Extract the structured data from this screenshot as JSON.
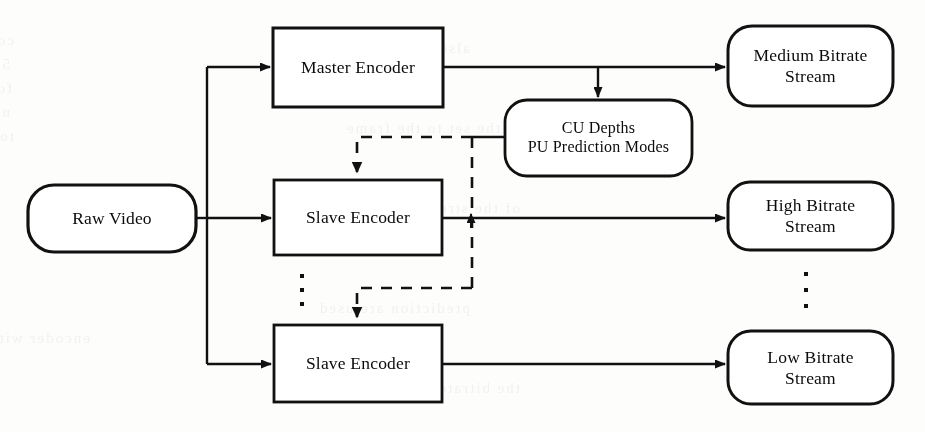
{
  "diagram": {
    "type": "block-flow-diagram",
    "background_color": "#fdfdfc",
    "line_color": "#111111",
    "nodes": [
      {
        "id": "raw-video",
        "label": "Raw Video",
        "shape": "stadium",
        "x": 28,
        "y": 185,
        "w": 168,
        "h": 67
      },
      {
        "id": "master-encoder",
        "label": "Master Encoder",
        "shape": "rectangle",
        "x": 273,
        "y": 28,
        "w": 170,
        "h": 79
      },
      {
        "id": "slave-encoder-1",
        "label": "Slave Encoder",
        "shape": "rectangle",
        "x": 274,
        "y": 180,
        "w": 168,
        "h": 75
      },
      {
        "id": "slave-encoder-2",
        "label": "Slave Encoder",
        "shape": "rectangle",
        "x": 274,
        "y": 325,
        "w": 168,
        "h": 77
      },
      {
        "id": "cu-depths",
        "label_line_1": "CU Depths",
        "label_line_2": "PU Prediction Modes",
        "shape": "rounded",
        "x": 505,
        "y": 100,
        "w": 187,
        "h": 76
      },
      {
        "id": "medium-stream",
        "label_line_1": "Medium Bitrate",
        "label_line_2": "Stream",
        "shape": "rounded",
        "x": 728,
        "y": 26,
        "w": 165,
        "h": 80
      },
      {
        "id": "high-stream",
        "label_line_1": "High Bitrate",
        "label_line_2": "Stream",
        "shape": "rounded",
        "x": 728,
        "y": 182,
        "w": 165,
        "h": 68
      },
      {
        "id": "low-stream",
        "label_line_1": "Low Bitrate",
        "label_line_2": "Stream",
        "shape": "rounded",
        "x": 728,
        "y": 331,
        "w": 165,
        "h": 73
      }
    ],
    "ellipses": [
      {
        "id": "encoder-ellipsis",
        "x": 301,
        "y": 274
      },
      {
        "id": "stream-ellipsis",
        "x": 805,
        "y": 272
      }
    ],
    "edges": [
      {
        "id": "raw-to-bus",
        "style": "solid",
        "from": "raw-video",
        "to": "distribution-bus"
      },
      {
        "id": "bus-to-master",
        "style": "solid",
        "from": "distribution-bus",
        "to": "master-encoder"
      },
      {
        "id": "bus-to-slave-1",
        "style": "solid",
        "from": "distribution-bus",
        "to": "slave-encoder-1"
      },
      {
        "id": "bus-to-slave-2",
        "style": "solid",
        "from": "distribution-bus",
        "to": "slave-encoder-2"
      },
      {
        "id": "master-to-medium",
        "style": "solid",
        "from": "master-encoder",
        "to": "medium-stream"
      },
      {
        "id": "master-to-cu",
        "style": "solid",
        "from": "master-encoder",
        "to": "cu-depths"
      },
      {
        "id": "cu-to-slave-1",
        "style": "dashed",
        "from": "cu-depths",
        "to": "slave-encoder-1"
      },
      {
        "id": "cu-to-slave-2",
        "style": "dashed",
        "from": "cu-depths",
        "to": "slave-encoder-2"
      },
      {
        "id": "slave-1-to-high",
        "style": "solid",
        "from": "slave-encoder-1",
        "to": "high-stream"
      },
      {
        "id": "slave-2-to-low",
        "style": "solid",
        "from": "slave-encoder-2",
        "to": "low-stream"
      }
    ]
  },
  "ghost_text": [
    {
      "text": "corner of ye to  before",
      "x": 14,
      "y": 32
    },
    {
      "text": "56 and  of  is  the",
      "x": 10,
      "y": 56
    },
    {
      "text": "for  the  mode  ont",
      "x": 12,
      "y": 80
    },
    {
      "text": "not  of  m  and",
      "x": 10,
      "y": 104
    },
    {
      "text": "to  the  bits",
      "x": 14,
      "y": 128
    },
    {
      "text": "also the  rate   coded",
      "x": 470,
      "y": 40
    },
    {
      "text": "the  set  to  the  frame",
      "x": 500,
      "y": 120
    },
    {
      "text": "of  the  stream  and",
      "x": 520,
      "y": 200
    },
    {
      "text": "encoder  with  the",
      "x": 90,
      "y": 330
    },
    {
      "text": "prediction  are  used",
      "x": 470,
      "y": 300
    },
    {
      "text": "the  bitrate  stream",
      "x": 520,
      "y": 380
    }
  ]
}
